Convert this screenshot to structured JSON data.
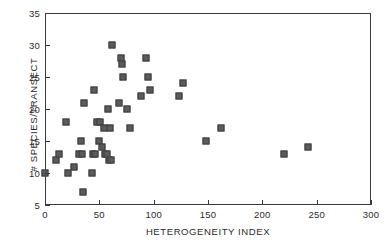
{
  "chart_data": {
    "type": "scatter",
    "title": "",
    "xlabel": "HETEROGENEITY INDEX",
    "ylabel": "# SPECIES/TRANSECT",
    "xlim": [
      0,
      300
    ],
    "ylim": [
      5,
      35
    ],
    "xticks": [
      0,
      50,
      100,
      150,
      200,
      250,
      300
    ],
    "yticks": [
      5,
      10,
      15,
      20,
      25,
      30,
      35
    ],
    "grid": false,
    "legend": null,
    "marker": {
      "shape": "square",
      "fill": "#5b5b5d",
      "edge": "#3d3d3f",
      "size_px": 7
    },
    "series": [
      {
        "name": "observations",
        "points": [
          [
            0,
            10
          ],
          [
            10,
            12
          ],
          [
            13,
            13
          ],
          [
            19,
            18
          ],
          [
            21,
            10
          ],
          [
            27,
            11
          ],
          [
            31,
            13
          ],
          [
            33,
            15
          ],
          [
            34,
            13
          ],
          [
            35,
            7
          ],
          [
            36,
            21
          ],
          [
            43,
            10
          ],
          [
            44,
            13
          ],
          [
            45,
            23
          ],
          [
            46,
            13
          ],
          [
            48,
            18
          ],
          [
            50,
            15
          ],
          [
            51,
            18
          ],
          [
            52,
            14
          ],
          [
            54,
            17
          ],
          [
            55,
            13
          ],
          [
            57,
            13
          ],
          [
            58,
            20
          ],
          [
            59,
            12
          ],
          [
            60,
            17
          ],
          [
            61,
            12
          ],
          [
            62,
            30
          ],
          [
            68,
            21
          ],
          [
            70,
            28
          ],
          [
            71,
            27
          ],
          [
            72,
            25
          ],
          [
            75,
            20
          ],
          [
            78,
            17
          ],
          [
            88,
            22
          ],
          [
            93,
            28
          ],
          [
            95,
            25
          ],
          [
            97,
            23
          ],
          [
            123,
            22
          ],
          [
            127,
            24
          ],
          [
            148,
            15
          ],
          [
            162,
            17
          ],
          [
            220,
            13
          ],
          [
            242,
            14
          ]
        ]
      }
    ]
  },
  "axes": {
    "x_tick_labels": [
      "0",
      "50",
      "100",
      "150",
      "200",
      "250",
      "300"
    ],
    "y_tick_labels": [
      "5",
      "10",
      "15",
      "20",
      "25",
      "30",
      "35"
    ]
  }
}
